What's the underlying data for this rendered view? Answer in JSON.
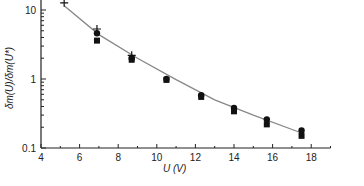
{
  "chart_data": {
    "type": "scatter",
    "title": "",
    "xlabel": "U (V)",
    "ylabel": "δm(U)/δm(U*)",
    "xlim": [
      4,
      19
    ],
    "ylim": [
      0.1,
      14
    ],
    "yscale": "log",
    "x_ticks": [
      "4",
      "6",
      "8",
      "10",
      "12",
      "14",
      "16",
      "18"
    ],
    "y_ticks": [
      "0.1",
      "1",
      "10"
    ],
    "grid": false,
    "legend": null,
    "series": [
      {
        "name": "cross",
        "marker": "+",
        "x": [
          5.2,
          6.9,
          8.7
        ],
        "y": [
          12.7,
          5.3,
          2.2
        ]
      },
      {
        "name": "circle",
        "marker": "circle",
        "x": [
          6.9,
          8.7,
          10.5,
          12.3,
          14.0,
          15.7,
          17.5
        ],
        "y": [
          4.6,
          2.0,
          1.0,
          0.58,
          0.38,
          0.26,
          0.18
        ]
      },
      {
        "name": "square",
        "marker": "square",
        "x": [
          6.9,
          8.7,
          10.5,
          12.3,
          14.0,
          15.7,
          17.5
        ],
        "y": [
          3.6,
          1.9,
          0.97,
          0.55,
          0.34,
          0.22,
          0.15
        ]
      },
      {
        "name": "fit",
        "type": "line",
        "color": "#888888",
        "x": [
          5.2,
          7,
          9,
          11,
          13,
          15,
          17.5
        ],
        "y": [
          11.5,
          4.4,
          2.0,
          0.98,
          0.5,
          0.3,
          0.165
        ]
      }
    ]
  }
}
